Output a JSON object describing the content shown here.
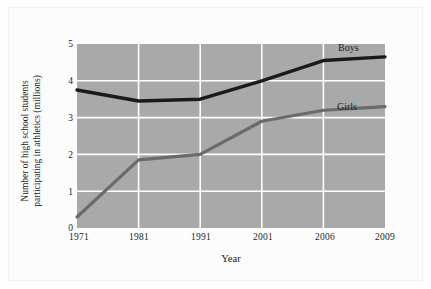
{
  "chart_data": {
    "type": "line",
    "title": "",
    "xlabel": "Year",
    "ylabel": "Number of high school students participating in athletics (millions)",
    "ylabel_line1": "Number of high school students",
    "ylabel_line2": "participating in athletics (millions)",
    "categories": [
      "1971",
      "1981",
      "1991",
      "2001",
      "2006",
      "2009"
    ],
    "x_tick_labels": [
      "1971",
      "1981",
      "1991",
      "2001",
      "2006",
      "2009"
    ],
    "y_tick_labels": [
      "0",
      "1",
      "2",
      "3",
      "4",
      "5"
    ],
    "y_ticks": [
      0,
      1,
      2,
      3,
      4,
      5
    ],
    "ylim": [
      0,
      5
    ],
    "grid": true,
    "grid_color": "#ffffff",
    "plot_background": "#a9a9a9",
    "legend_position": "inline-labels",
    "series": [
      {
        "name": "Boys",
        "color": "#1a1a1a",
        "values": [
          3.75,
          3.45,
          3.5,
          4.0,
          4.55,
          4.65
        ]
      },
      {
        "name": "Girls",
        "color": "#6b6b6b",
        "values": [
          0.3,
          1.85,
          2.0,
          2.9,
          3.2,
          3.3
        ]
      }
    ],
    "annotations": [
      {
        "text": "Boys",
        "series": "Boys"
      },
      {
        "text": "Girls",
        "series": "Girls"
      }
    ]
  }
}
